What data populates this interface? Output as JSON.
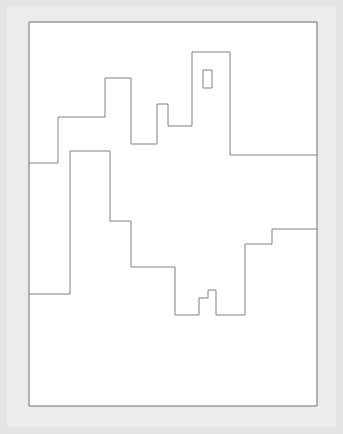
{
  "document": {
    "title": "Polyline Region Drawing",
    "kind": "line-drawing",
    "width": 343,
    "height": 434
  },
  "colors": {
    "page_background": "#ffffff",
    "mat_outer": "#e4e4e4",
    "mat_inner": "#ececec",
    "paper_fill": "#ffffff",
    "stroke": "#808080",
    "border_stroke": "#6e6e6e"
  },
  "frame": {
    "outer": {
      "x": 0,
      "y": 0,
      "width": 343,
      "height": 434
    },
    "inner": {
      "x": 7,
      "y": 7,
      "width": 329,
      "height": 420
    }
  },
  "paper": {
    "x": 29,
    "y": 22,
    "width": 288,
    "height": 384,
    "stroke_width": 1
  },
  "shapes": [
    {
      "name": "outer-border",
      "type": "rect",
      "d": "M 29 22 L 317 22 L 317 406 L 29 406 Z",
      "stroke_width": 1,
      "stroke": "#6e6e6e"
    },
    {
      "name": "upper-contour",
      "type": "polyline",
      "d": "M 29 163 L 58 163 L 58 117 L 105 117 L 105 78 L 131 78 L 131 144 L 157 144 L 157 104 L 168 104 L 168 126 L 192 126 L 192 52 L 230 52 L 230 155 L 317 155",
      "stroke_width": 1,
      "stroke": "#808080"
    },
    {
      "name": "tower-window",
      "type": "rect",
      "d": "M 203 70 L 212 70 L 212 88 L 203 88 Z",
      "stroke_width": 1,
      "stroke": "#808080"
    },
    {
      "name": "lower-contour",
      "type": "polyline",
      "d": "M 29 294 L 70 294 L 70 151 L 110 151 L 110 221 L 131 221 L 131 267 L 175 267 L 175 315 L 199 315 L 199 298 L 208 298 L 208 290 L 216 290 L 216 315 L 245 315 L 245 244 L 272 244 L 272 229 L 317 229",
      "stroke_width": 1,
      "stroke": "#808080"
    }
  ],
  "labels": {
    "none": ""
  }
}
